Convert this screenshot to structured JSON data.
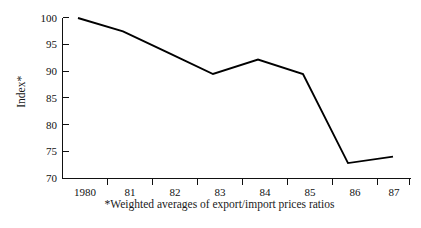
{
  "chart_data": {
    "type": "line",
    "title": "",
    "subtitle": "",
    "xlabel": "",
    "ylabel": "Index*",
    "footnote": "*Weighted averages of export/import prices ratios",
    "categories": [
      "1980",
      "81",
      "82",
      "83",
      "84",
      "85",
      "86",
      "87"
    ],
    "x": [
      1980,
      1981,
      1982,
      1983,
      1984,
      1985,
      1986,
      1987
    ],
    "values": [
      100,
      97.5,
      93.5,
      89.5,
      92.2,
      89.5,
      72.8,
      74
    ],
    "series": [
      {
        "name": "Index*",
        "values": [
          100,
          97.5,
          93.5,
          89.5,
          92.2,
          89.5,
          72.8,
          74
        ]
      }
    ],
    "ylim": [
      70,
      100
    ],
    "yticks": [
      70,
      75,
      80,
      85,
      90,
      95,
      100
    ],
    "ytick_labels": [
      "70",
      "75",
      "80",
      "85",
      "90",
      "95",
      "100"
    ],
    "xlim": [
      1979.6,
      1987.6
    ],
    "grid": false,
    "legend": false,
    "legend_position": "none",
    "line_color": "#000000",
    "axis_color": "#111111",
    "background_color": "#ffffff"
  },
  "axis": {
    "y_title": "Index*",
    "tick_labels_y": [
      "100",
      "95",
      "90",
      "85",
      "80",
      "75",
      "70"
    ],
    "tick_labels_x": [
      "1980",
      "81",
      "82",
      "83",
      "84",
      "85",
      "86",
      "87"
    ]
  },
  "footnote": {
    "text": "*Weighted averages of export/import prices ratios"
  }
}
